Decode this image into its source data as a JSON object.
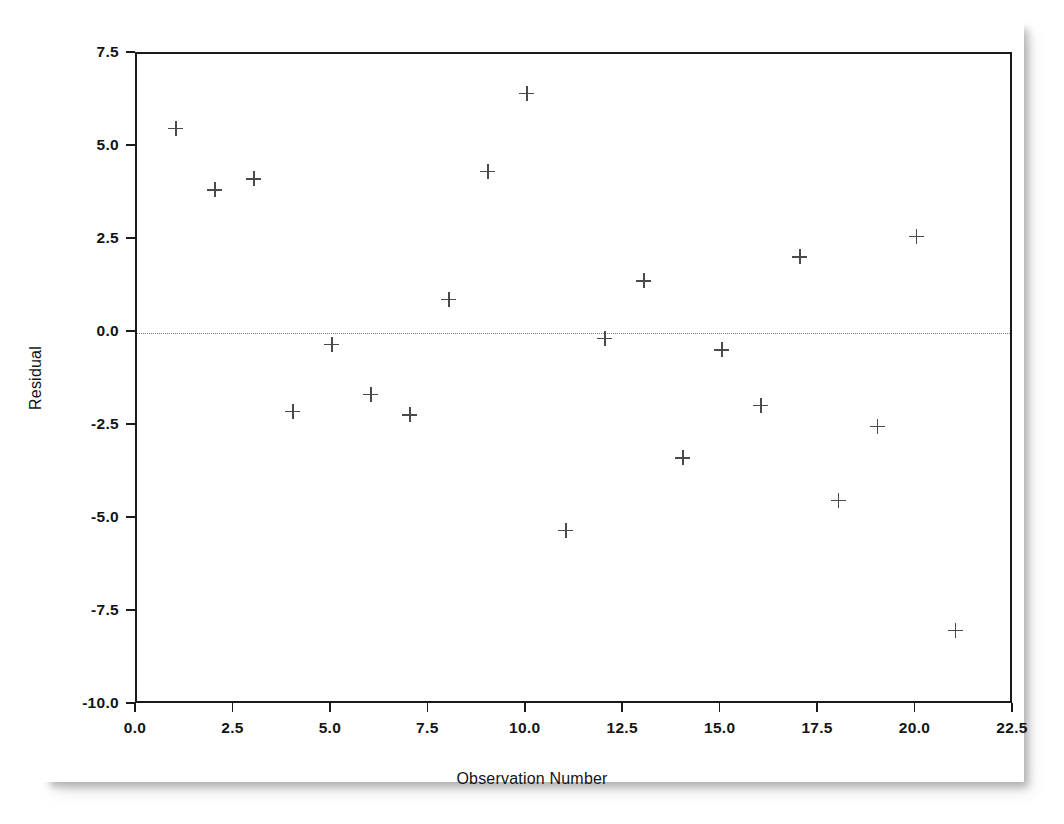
{
  "chart_data": {
    "type": "scatter",
    "title": "",
    "xlabel": "Observation Number",
    "ylabel": "Residual",
    "xlim": [
      0.0,
      22.5
    ],
    "ylim": [
      -10.0,
      7.5
    ],
    "xticks": [
      "0.0",
      "2.5",
      "5.0",
      "7.5",
      "10.0",
      "12.5",
      "15.0",
      "17.5",
      "20.0",
      "22.5"
    ],
    "xtick_values": [
      0.0,
      2.5,
      5.0,
      7.5,
      10.0,
      12.5,
      15.0,
      17.5,
      20.0,
      22.5
    ],
    "yticks": [
      "7.5",
      "5.0",
      "2.5",
      "0.0",
      "-2.5",
      "-5.0",
      "-7.5",
      "-10.0"
    ],
    "ytick_values": [
      7.5,
      5.0,
      2.5,
      0.0,
      -2.5,
      -5.0,
      -7.5,
      -10.0
    ],
    "grid": false,
    "legend": null,
    "marker": "plus",
    "marker_color": "#4a4a4a",
    "reference_line": {
      "type": "horizontal",
      "y": 0.0,
      "style": "dotted",
      "color": "#7a7a7a"
    },
    "x": [
      1,
      2,
      3,
      4,
      5,
      6,
      7,
      8,
      9,
      10,
      11,
      12,
      13,
      14,
      15,
      16,
      17,
      18,
      19,
      20,
      21
    ],
    "y": [
      5.5,
      3.85,
      4.15,
      -2.1,
      -0.3,
      -1.65,
      -2.2,
      0.9,
      4.35,
      6.45,
      -5.3,
      -0.15,
      1.4,
      -3.35,
      -0.45,
      -1.95,
      2.05,
      -4.5,
      -2.5,
      2.6,
      -8.0
    ],
    "points": [
      {
        "x": 1,
        "y": 5.5
      },
      {
        "x": 2,
        "y": 3.85
      },
      {
        "x": 3,
        "y": 4.15
      },
      {
        "x": 4,
        "y": -2.1
      },
      {
        "x": 5,
        "y": -0.3
      },
      {
        "x": 6,
        "y": -1.65
      },
      {
        "x": 7,
        "y": -2.2
      },
      {
        "x": 8,
        "y": 0.9
      },
      {
        "x": 9,
        "y": 4.35
      },
      {
        "x": 10,
        "y": 6.45
      },
      {
        "x": 11,
        "y": -5.3
      },
      {
        "x": 12,
        "y": -0.15
      },
      {
        "x": 13,
        "y": 1.4
      },
      {
        "x": 14,
        "y": -3.35
      },
      {
        "x": 15,
        "y": -0.45
      },
      {
        "x": 16,
        "y": -1.95
      },
      {
        "x": 17,
        "y": 2.05
      },
      {
        "x": 18,
        "y": -4.5
      },
      {
        "x": 19,
        "y": -2.5
      },
      {
        "x": 20,
        "y": 2.6
      },
      {
        "x": 21,
        "y": -8.0
      }
    ]
  },
  "figure": {
    "axis_color": "#1a1a1a",
    "background": "#ffffff"
  }
}
